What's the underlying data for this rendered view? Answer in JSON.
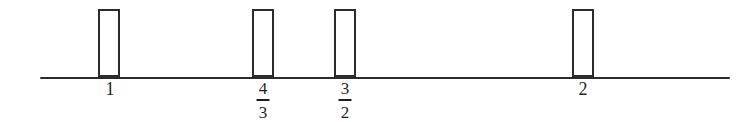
{
  "figure": {
    "background_color": "#ffffff",
    "ink_color": "#2b2b2b",
    "label_color": "#1f1f1f"
  },
  "axis": {
    "name": "number-line",
    "y": 77,
    "x_start": 40,
    "x_end": 730,
    "thickness": 2
  },
  "marks": [
    {
      "id": "mark-1",
      "label_text": "1",
      "label_kind": "integer",
      "numerator": "",
      "denominator": "",
      "value": 1,
      "bar_left": 98,
      "bar_width": 22,
      "bar_top": 9,
      "bar_height": 68,
      "label_center_x": 110,
      "label_top": 80
    },
    {
      "id": "mark-4-3",
      "label_text": "4/3",
      "label_kind": "fraction",
      "numerator": "4",
      "denominator": "3",
      "value": 1.3333,
      "bar_left": 252,
      "bar_width": 22,
      "bar_top": 9,
      "bar_height": 68,
      "label_center_x": 263,
      "label_top": 80
    },
    {
      "id": "mark-3-2",
      "label_text": "3/2",
      "label_kind": "fraction",
      "numerator": "3",
      "denominator": "2",
      "value": 1.5,
      "bar_left": 334,
      "bar_width": 22,
      "bar_top": 9,
      "bar_height": 68,
      "label_center_x": 345,
      "label_top": 80
    },
    {
      "id": "mark-2",
      "label_text": "2",
      "label_kind": "integer",
      "numerator": "",
      "denominator": "",
      "value": 2,
      "bar_left": 572,
      "bar_width": 22,
      "bar_top": 9,
      "bar_height": 68,
      "label_center_x": 583,
      "label_top": 80
    }
  ],
  "chart_data": {
    "type": "bar",
    "title": "",
    "subtitle": "",
    "xlabel": "",
    "ylabel": "",
    "categories": [
      "1",
      "4/3",
      "3/2",
      "2"
    ],
    "x": [
      1,
      1.3333,
      1.5,
      2
    ],
    "values": [
      1,
      1,
      1,
      1
    ],
    "tick_labels": [
      "1",
      "4/3",
      "3/2",
      "2"
    ],
    "bar_style": "open-outline",
    "bar_fill": "none",
    "bar_edge_color": "#2b2b2b",
    "bar_pixel_width": 22,
    "bar_pixel_height": 68,
    "xlim": [
      0.72,
      2.65
    ],
    "ylim": [
      0,
      1
    ],
    "grid": false,
    "legend": null,
    "legend_position": "none",
    "axis_visible": {
      "x": true,
      "y": false
    },
    "annotations": []
  }
}
